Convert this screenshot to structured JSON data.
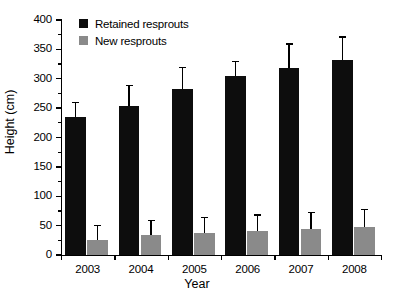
{
  "chart_data": {
    "type": "bar",
    "title": "",
    "xlabel": "Year",
    "ylabel": "Height (cm)",
    "categories": [
      "2003",
      "2004",
      "2005",
      "2006",
      "2007",
      "2008"
    ],
    "series": [
      {
        "name": "Retained resprouts",
        "color": "#0d0d0d",
        "values": [
          235,
          253,
          282,
          304,
          318,
          332
        ],
        "errors": [
          24,
          35,
          36,
          24,
          40,
          38
        ]
      },
      {
        "name": "New resprouts",
        "color": "#8a8a8a",
        "values": [
          25,
          34,
          37,
          41,
          44,
          47
        ],
        "errors": [
          24,
          24,
          26,
          26,
          27,
          29
        ]
      }
    ],
    "ylim": [
      0,
      400
    ],
    "ytick_labels": [
      "0",
      "50",
      "100",
      "150",
      "200",
      "250",
      "300",
      "350",
      "400"
    ],
    "ytick_values": [
      0,
      50,
      100,
      150,
      200,
      250,
      300,
      350,
      400
    ],
    "yminor_interval": 25,
    "grid": false,
    "legend_position": "top-left",
    "error_bar_style": "upper-only-with-cap"
  },
  "legend": {
    "items": [
      {
        "label": "Retained resprouts",
        "swatch": "retained"
      },
      {
        "label": "New resprouts",
        "swatch": "newsprout"
      }
    ]
  },
  "axes": {
    "y_title": "Height (cm)",
    "x_title": "Year"
  }
}
